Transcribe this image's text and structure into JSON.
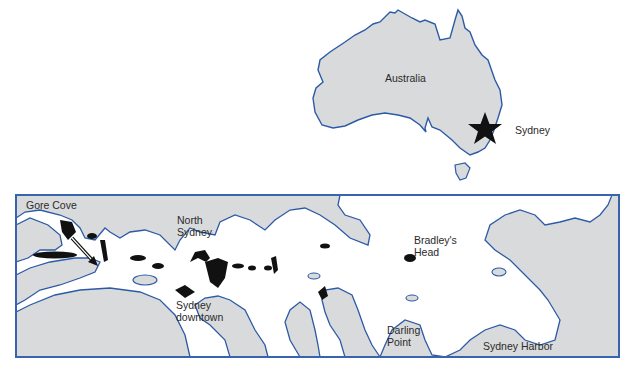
{
  "inset_map": {
    "country_label": "Australia",
    "city_label": "Sydney",
    "marker": "star-icon"
  },
  "harbor_map": {
    "labels": {
      "gore_cove": "Gore Cove",
      "north_sydney": "North\nSydney",
      "sydney_downtown": "Sydney\ndowntown",
      "bradleys_head": "Bradley's\nHead",
      "darling_point": "Darling\nPoint",
      "sydney_harbor": "Sydney Harbor"
    },
    "marker": "arrow-icon"
  },
  "colors": {
    "land": "#d9dadc",
    "water": "#ffffff",
    "coastline": "#2d5aa6",
    "frame": "#3a63ad",
    "highlight": "#111111",
    "text": "#2a2a2a"
  }
}
